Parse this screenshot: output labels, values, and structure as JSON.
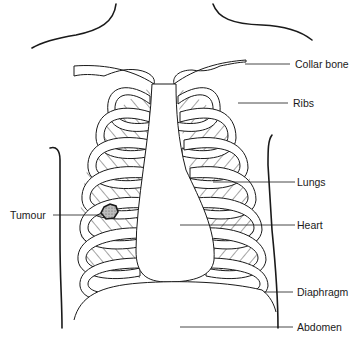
{
  "figure": {
    "type": "anatomical-diagram"
  },
  "labels": {
    "collar_bone": "Collar bone",
    "ribs": "Ribs",
    "lungs": "Lungs",
    "heart": "Heart",
    "diaphragm": "Diaphragm",
    "abdomen": "Abdomen",
    "tumour": "Tumour"
  },
  "colors": {
    "ink": "#1a1a1a",
    "background": "#ffffff",
    "tumour_fill": "#9a9a9a"
  }
}
